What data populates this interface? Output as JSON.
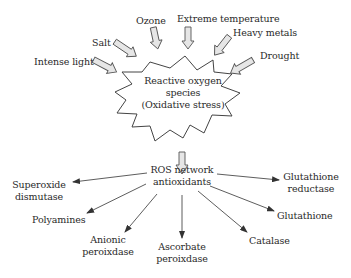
{
  "diagram": {
    "stressors": [
      {
        "label": "Intense light"
      },
      {
        "label": "Salt"
      },
      {
        "label": "Ozone"
      },
      {
        "label": "Extreme temperature"
      },
      {
        "label": "Heavy metals"
      },
      {
        "label": "Drought"
      }
    ],
    "center": {
      "line1": "Reactive oxygen",
      "line2": "species",
      "line3": "(Oxidative stress)"
    },
    "network": {
      "line1": "ROS network",
      "line2": "antioxidants"
    },
    "antioxidants": [
      {
        "line1": "Superoxide",
        "line2": "dismutase"
      },
      {
        "line1": "Polyamines",
        "line2": ""
      },
      {
        "line1": "Anionic",
        "line2": "peroixdase"
      },
      {
        "line1": "Ascorbate",
        "line2": "peroixdase"
      },
      {
        "line1": "Catalase",
        "line2": ""
      },
      {
        "line1": "Glutathione",
        "line2": ""
      },
      {
        "line1": "Glutathione",
        "line2": "reductase"
      }
    ],
    "colors": {
      "text": "#2a2a2a",
      "line": "#333333",
      "block_arrow_fill": "#e6e6e6",
      "block_arrow_stroke": "#555555"
    }
  }
}
